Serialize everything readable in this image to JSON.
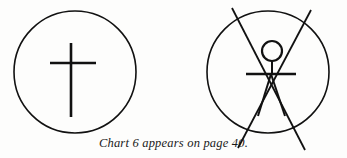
{
  "page": {
    "background_color": "#fdfdfc",
    "ink_color": "#111111"
  },
  "caption": {
    "text": "Chart 6 appears on page 40."
  },
  "figures": [
    {
      "id": "figure-left",
      "name": "circle-with-cross",
      "description": "Circle enclosing an upright cross",
      "circle": {
        "cx": 75,
        "cy": 72,
        "r": 61
      },
      "cross": {
        "vertical": {
          "x": 71,
          "y1": 43,
          "y2": 117
        },
        "horizontal": {
          "y": 63,
          "x1": 50,
          "x2": 96
        }
      }
    },
    {
      "id": "figure-right",
      "name": "circle-with-stick-figure",
      "description": "Circle enclosing a stick figure with two long diagonals crossing through it",
      "circle": {
        "cx": 268,
        "cy": 72,
        "r": 61
      },
      "head": {
        "cx": 272,
        "cy": 51,
        "r": 10
      },
      "neck": {
        "x": 272,
        "y1": 61,
        "y2": 74
      },
      "arms": {
        "y": 74,
        "x1": 246,
        "x2": 296
      },
      "legs": [
        {
          "x1": 271,
          "y1": 74,
          "x2": 258,
          "y2": 116
        },
        {
          "x1": 271,
          "y1": 74,
          "x2": 285,
          "y2": 116
        }
      ],
      "diagonals": [
        {
          "x1": 232,
          "y1": 8,
          "x2": 305,
          "y2": 150
        },
        {
          "x1": 311,
          "y1": 10,
          "x2": 238,
          "y2": 148
        }
      ]
    }
  ]
}
